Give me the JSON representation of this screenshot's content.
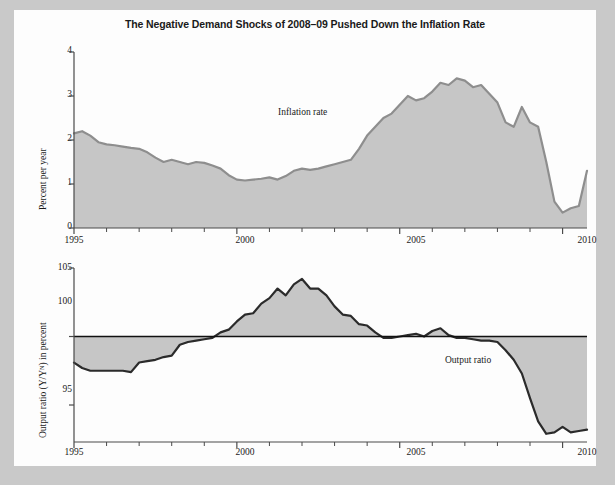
{
  "title": "The Negative Demand Shocks of 2008–09 Pushed Down the Inflation Rate",
  "colors": {
    "area_fill": "#c6c6c6",
    "line_top": "#8e8e8e",
    "line_bottom": "#2b2b2b",
    "axis": "#4a4a4a",
    "page": "#fdfdfd",
    "background": "#c9c9c9"
  },
  "chart_data": [
    {
      "type": "area",
      "id": "inflation-rate",
      "title": "The Negative Demand Shocks of 2008–09 Pushed Down the Inflation Rate",
      "xlabel": "",
      "ylabel": "Percent per year",
      "annotation": "Inflation rate",
      "xlim": [
        1995,
        2010.75
      ],
      "ylim": [
        0,
        4
      ],
      "ytick_labels": [
        "0",
        "1",
        "2",
        "3",
        "4"
      ],
      "yticks": [
        0,
        1,
        2,
        3,
        4
      ],
      "xtick_labels": [
        "1995",
        "2000",
        "2005",
        "2010"
      ],
      "xticks_major": [
        1995,
        2000,
        2005,
        2010
      ],
      "xticks_minor": [
        1996,
        1997,
        1998,
        1999,
        2001,
        2002,
        2003,
        2004,
        2006,
        2007,
        2008,
        2009
      ],
      "grid": false,
      "legend": "none",
      "x": [
        1995.0,
        1995.25,
        1995.5,
        1995.75,
        1996.0,
        1996.25,
        1996.5,
        1996.75,
        1997.0,
        1997.25,
        1997.5,
        1997.75,
        1998.0,
        1998.25,
        1998.5,
        1998.75,
        1999.0,
        1999.25,
        1999.5,
        1999.75,
        2000.0,
        2000.25,
        2000.5,
        2000.75,
        2001.0,
        2001.25,
        2001.5,
        2001.75,
        2002.0,
        2002.25,
        2002.5,
        2002.75,
        2003.0,
        2003.25,
        2003.5,
        2003.75,
        2004.0,
        2004.25,
        2004.5,
        2004.75,
        2005.0,
        2005.25,
        2005.5,
        2005.75,
        2006.0,
        2006.25,
        2006.5,
        2006.75,
        2007.0,
        2007.25,
        2007.5,
        2007.75,
        2008.0,
        2008.25,
        2008.5,
        2008.75,
        2009.0,
        2009.25,
        2009.5,
        2009.75,
        2010.0,
        2010.25,
        2010.5,
        2010.75
      ],
      "values": [
        2.15,
        2.2,
        2.1,
        1.95,
        1.9,
        1.88,
        1.85,
        1.82,
        1.8,
        1.72,
        1.6,
        1.5,
        1.55,
        1.5,
        1.45,
        1.5,
        1.48,
        1.42,
        1.35,
        1.2,
        1.1,
        1.08,
        1.1,
        1.12,
        1.15,
        1.1,
        1.18,
        1.3,
        1.35,
        1.32,
        1.35,
        1.4,
        1.45,
        1.5,
        1.55,
        1.8,
        2.1,
        2.3,
        2.5,
        2.6,
        2.8,
        3.0,
        2.9,
        2.95,
        3.1,
        3.3,
        3.25,
        3.4,
        3.35,
        3.2,
        3.25,
        3.05,
        2.85,
        2.4,
        2.3,
        2.75,
        2.4,
        2.3,
        1.5,
        0.6,
        0.35,
        0.45,
        0.5,
        1.3
      ]
    },
    {
      "type": "area",
      "id": "output-ratio",
      "title": "",
      "xlabel": "",
      "ylabel": "Output ratio (Y/Yᴺ) in percent",
      "annotation": "Output ratio",
      "reference_line": 100,
      "xlim": [
        1995,
        2010.75
      ],
      "ylim": [
        92.3,
        105
      ],
      "ytick_labels": [
        "95",
        "100",
        "105"
      ],
      "yticks": [
        95,
        100,
        105
      ],
      "xtick_labels": [
        "1995",
        "2000",
        "2005",
        "2010"
      ],
      "xticks_major": [
        1995,
        2000,
        2005,
        2010
      ],
      "xticks_minor": [
        1996,
        1997,
        1998,
        1999,
        2001,
        2002,
        2003,
        2004,
        2006,
        2007,
        2008,
        2009
      ],
      "grid": false,
      "legend": "none",
      "x": [
        1995.0,
        1995.25,
        1995.5,
        1995.75,
        1996.0,
        1996.25,
        1996.5,
        1996.75,
        1997.0,
        1997.25,
        1997.5,
        1997.75,
        1998.0,
        1998.25,
        1998.5,
        1998.75,
        1999.0,
        1999.25,
        1999.5,
        1999.75,
        2000.0,
        2000.25,
        2000.5,
        2000.75,
        2001.0,
        2001.25,
        2001.5,
        2001.75,
        2002.0,
        2002.25,
        2002.5,
        2002.75,
        2003.0,
        2003.25,
        2003.5,
        2003.75,
        2004.0,
        2004.25,
        2004.5,
        2004.75,
        2005.0,
        2005.25,
        2005.5,
        2005.75,
        2006.0,
        2006.25,
        2006.5,
        2006.75,
        2007.0,
        2007.25,
        2007.5,
        2007.75,
        2008.0,
        2008.25,
        2008.5,
        2008.75,
        2009.0,
        2009.25,
        2009.5,
        2009.75,
        2010.0,
        2010.25,
        2010.5,
        2010.75
      ],
      "values": [
        98.1,
        97.7,
        97.5,
        97.5,
        97.5,
        97.5,
        97.5,
        97.4,
        98.1,
        98.2,
        98.3,
        98.5,
        98.6,
        99.4,
        99.6,
        99.7,
        99.8,
        99.9,
        100.3,
        100.5,
        101.1,
        101.6,
        101.7,
        102.4,
        102.8,
        103.5,
        103.0,
        103.8,
        104.2,
        103.5,
        103.5,
        103.0,
        102.2,
        101.6,
        101.5,
        100.9,
        100.8,
        100.3,
        99.9,
        99.9,
        100.0,
        100.1,
        100.2,
        100.0,
        100.4,
        100.6,
        100.1,
        99.9,
        99.9,
        99.8,
        99.7,
        99.7,
        99.6,
        99.0,
        98.3,
        97.3,
        95.5,
        93.8,
        92.9,
        93.0,
        93.4,
        93.0,
        93.1,
        93.2
      ]
    }
  ],
  "top": {
    "axis_title": "Percent per year",
    "annotation": "Inflation rate",
    "ytick_labels": [
      "4",
      "3",
      "2",
      "1",
      "0"
    ],
    "xtick_labels": [
      "1995",
      "2000",
      "2005",
      "2010"
    ]
  },
  "bottom": {
    "axis_title": "Output ratio (Y/Yᴺ) in percent",
    "annotation": "Output ratio",
    "ytick_labels": [
      "105",
      "100",
      "95"
    ],
    "xtick_labels": [
      "1995",
      "2000",
      "2005",
      "2010"
    ]
  }
}
